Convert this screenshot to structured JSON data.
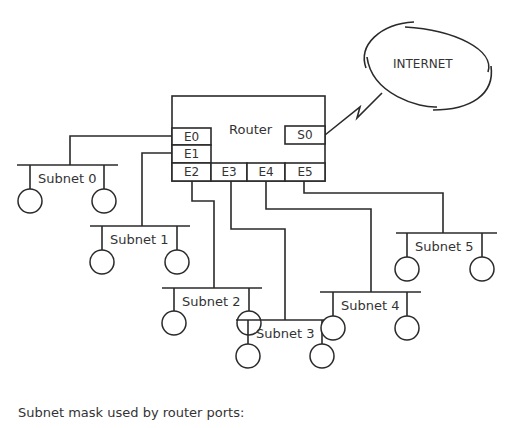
{
  "router": {
    "label": "Router",
    "ports": {
      "e0": "E0",
      "e1": "E1",
      "e2": "E2",
      "e3": "E3",
      "e4": "E4",
      "e5": "E5",
      "s0": "S0"
    }
  },
  "internet": {
    "label": "INTERNET"
  },
  "subnets": [
    {
      "label": "Subnet  0",
      "port": "E0"
    },
    {
      "label": "Subnet  1",
      "port": "E1"
    },
    {
      "label": "Subnet  2",
      "port": "E2"
    },
    {
      "label": "Subnet  3",
      "port": "E3"
    },
    {
      "label": "Subnet  4",
      "port": "E4"
    },
    {
      "label": "Subnet  5",
      "port": "E5"
    }
  ],
  "caption": "Subnet mask used by router ports:",
  "colors": {
    "stroke": "#2a2a2a",
    "background": "#ffffff"
  }
}
